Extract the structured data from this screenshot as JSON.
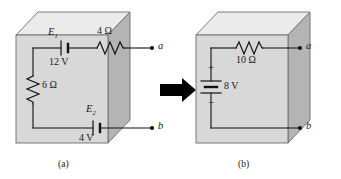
{
  "figure": {
    "type": "circuit-diagram",
    "colors": {
      "box_front": "#d8d8d8",
      "box_top": "#ebebeb",
      "box_side": "#b4b4b4",
      "outline": "#6e6e6e",
      "wire": "#111111",
      "arrow": "#000000",
      "background": "#ffffff",
      "text": "#1a1a1a"
    }
  },
  "panel_a": {
    "caption": "(a)",
    "components": [
      {
        "name": "E1",
        "symbol_label": "E",
        "subscript": "1",
        "value": "12 V",
        "kind": "battery"
      },
      {
        "name": "R1",
        "value": "4 Ω",
        "kind": "resistor"
      },
      {
        "name": "R2",
        "value": "6 Ω",
        "kind": "resistor"
      },
      {
        "name": "E2",
        "symbol_label": "E",
        "subscript": "2",
        "value": "4 V",
        "kind": "battery"
      }
    ],
    "labels": {
      "e1": "E",
      "e1_sub": "1",
      "v1": "12 V",
      "r_top": "4 Ω",
      "r_left": "6 Ω",
      "e2": "E",
      "e2_sub": "2",
      "v2": "4 V"
    },
    "terminals": {
      "top": "a",
      "bottom": "b"
    }
  },
  "panel_b": {
    "caption": "(b)",
    "components": [
      {
        "name": "Eth",
        "value": "8 V",
        "kind": "battery",
        "polarity_top": "+",
        "polarity_bottom": "−"
      },
      {
        "name": "Rth",
        "value": "10 Ω",
        "kind": "resistor"
      }
    ],
    "labels": {
      "r_top": "10 Ω",
      "v_source": "8 V",
      "plus": "+",
      "minus": "−"
    },
    "terminals": {
      "top": "a",
      "bottom": "b"
    }
  },
  "arrow": {
    "name": "transformation-arrow",
    "direction": "right"
  }
}
